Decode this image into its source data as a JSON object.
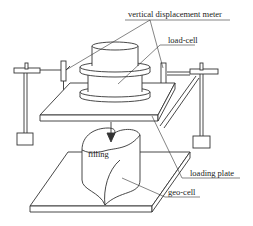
{
  "diagram": {
    "labels": {
      "vertical_displacement_meter": "vertical displacement meter",
      "load_cell": "load-cell",
      "loading_plate": "loading plate",
      "geo_cell": "geo-cell",
      "filling": "filling"
    },
    "components": [
      "vertical displacement meter (x2)",
      "load-cell",
      "loading plate",
      "geo-cell",
      "filling",
      "base plate",
      "support stands (x2)"
    ],
    "colors": {
      "line": "#333333",
      "background": "#ffffff"
    }
  }
}
